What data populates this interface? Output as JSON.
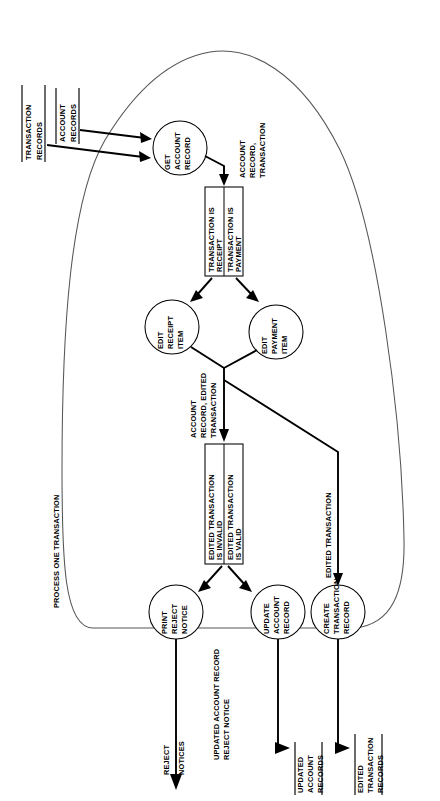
{
  "diagram": {
    "boundary_label": "PROCESS ONE TRANSACTION",
    "orientation": "rotated-90-ccw"
  },
  "inputs": [
    {
      "id": "transaction-records",
      "label": "TRANSACTION\nRECORDS",
      "line1": "TRANSACTION",
      "line2": "RECORDS"
    },
    {
      "id": "account-records",
      "label": "ACCOUNT\nRECORDS",
      "line1": "ACCOUNT",
      "line2": "RECORDS"
    }
  ],
  "processes": [
    {
      "id": "get-account-record",
      "lines": [
        "GET",
        "ACCOUNT",
        "RECORD"
      ]
    },
    {
      "id": "edit-receipt-item",
      "lines": [
        "EDIT",
        "RECEIPT",
        "ITEM"
      ]
    },
    {
      "id": "edit-payment-item",
      "lines": [
        "EDIT",
        "PAYMENT",
        "ITEM"
      ]
    },
    {
      "id": "print-reject-notice",
      "lines": [
        "PRINT",
        "REJECT",
        "NOTICE"
      ]
    },
    {
      "id": "update-account-record",
      "lines": [
        "UPDATE",
        "ACCOUNT",
        "RECORD"
      ]
    },
    {
      "id": "create-transaction-record",
      "lines": [
        "CREATE",
        "TRANSACTION",
        "RECORD"
      ]
    }
  ],
  "decisions": [
    {
      "id": "transaction-type",
      "options": [
        {
          "id": "transaction-is-receipt",
          "lines": [
            "TRANSACTION IS",
            "RECEIPT"
          ]
        },
        {
          "id": "transaction-is-payment",
          "lines": [
            "TRANSACTION IS",
            "PAYMENT"
          ]
        }
      ]
    },
    {
      "id": "edited-transaction-validity",
      "options": [
        {
          "id": "edited-transaction-is-invalid",
          "lines": [
            "EDITED TRANSACTION",
            "IS INVALID"
          ]
        },
        {
          "id": "edited-transaction-is-valid",
          "lines": [
            "EDITED TRANSACTION",
            "IS VALID"
          ]
        }
      ]
    }
  ],
  "flow_labels": [
    {
      "id": "account-record-transaction",
      "lines": [
        "ACCOUNT",
        "RECORD,",
        "TRANSACTION"
      ]
    },
    {
      "id": "account-record-edited-transaction",
      "lines": [
        "ACCOUNT",
        "RECORD, EDITED",
        "TRANSACTION"
      ]
    },
    {
      "id": "edited-transaction",
      "lines": [
        "EDITED TRANSACTION"
      ]
    },
    {
      "id": "updated-account-record-reject-notice",
      "lines": [
        "UPDATED ACCOUNT RECORD",
        "REJECT NOTICE"
      ]
    }
  ],
  "outputs": [
    {
      "id": "reject-notices",
      "lines": [
        "REJECT",
        "NOTICES"
      ],
      "ruled": false
    },
    {
      "id": "updated-account-records",
      "lines": [
        "UPDATED",
        "ACCOUNT",
        "RECORDS"
      ],
      "ruled": true
    },
    {
      "id": "edited-transaction-records",
      "lines": [
        "EDITED",
        "TRANSACTION",
        "RECORDS"
      ],
      "ruled": true
    }
  ],
  "colors": {
    "stroke": "#000000",
    "boundary": "#555555",
    "background": "#ffffff"
  }
}
